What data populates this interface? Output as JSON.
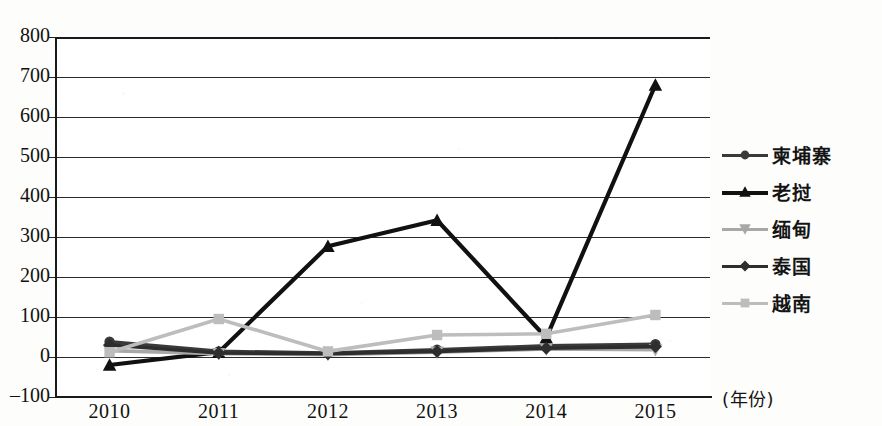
{
  "chart_data": {
    "type": "line",
    "title": "",
    "xlabel": "(年份)",
    "ylabel": "",
    "categories": [
      "2010",
      "2011",
      "2012",
      "2013",
      "2014",
      "2015"
    ],
    "x": [
      2010,
      2011,
      2012,
      2013,
      2014,
      2015
    ],
    "ylim": [
      -100,
      800
    ],
    "yticks": [
      -100,
      0,
      100,
      200,
      300,
      400,
      500,
      600,
      700,
      800
    ],
    "grid": true,
    "legend_position": "right",
    "series": [
      {
        "name": "柬埔寨",
        "marker": "circle",
        "color": "#3a3a3a",
        "values": [
          38,
          14,
          10,
          18,
          28,
          32
        ]
      },
      {
        "name": "老挝",
        "marker": "triangle",
        "color": "#111111",
        "values": [
          -20,
          12,
          277,
          342,
          48,
          680
        ]
      },
      {
        "name": "缅甸",
        "marker": "cross",
        "color": "#a8a8a8",
        "values": [
          16,
          8,
          6,
          12,
          20,
          18
        ]
      },
      {
        "name": "泰国",
        "marker": "diamond",
        "color": "#2e2e2e",
        "values": [
          30,
          10,
          8,
          14,
          22,
          26
        ]
      },
      {
        "name": "越南",
        "marker": "square",
        "color": "#bdbdbd",
        "values": [
          12,
          95,
          14,
          55,
          58,
          105
        ]
      }
    ]
  },
  "axis": {
    "y_tick_labels": [
      "800",
      "700",
      "600",
      "500",
      "400",
      "300",
      "200",
      "100",
      "0",
      "-100"
    ],
    "x_tick_labels": [
      "2010",
      "2011",
      "2012",
      "2013",
      "2014",
      "2015"
    ],
    "x_axis_note": "(年份)"
  },
  "legend": {
    "items": [
      {
        "label": "柬埔寨",
        "marker": "circle-marker-icon",
        "color": "#3a3a3a"
      },
      {
        "label": "老挝",
        "marker": "triangle-marker-icon",
        "color": "#111111"
      },
      {
        "label": "缅甸",
        "marker": "cross-marker-icon",
        "color": "#a8a8a8"
      },
      {
        "label": "泰国",
        "marker": "diamond-marker-icon",
        "color": "#2e2e2e"
      },
      {
        "label": "越南",
        "marker": "square-marker-icon",
        "color": "#bdbdbd"
      }
    ]
  },
  "colors": {
    "axis": "#1a1a1a",
    "grid": "#2b2b2b",
    "background": "#fdfdfb",
    "plot_background": "#ffffff"
  }
}
